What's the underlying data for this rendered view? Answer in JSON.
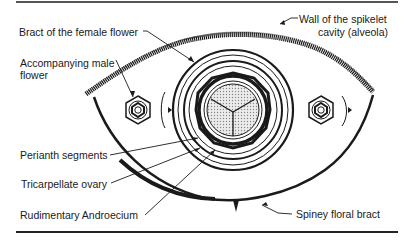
{
  "diagram": {
    "type": "floral-diagram",
    "labels": {
      "bract_female": "Bract of the female flower",
      "male_flower_line1": "Accompanying male",
      "male_flower_line2": "flower",
      "wall_line1": "Wall of the spikelet",
      "wall_line2": "cavity (alveola)",
      "perianth": "Perianth segments",
      "ovary": "Tricarpellate ovary",
      "androecium": "Rudimentary  Androecium",
      "spiney_bract": "Spiney floral bract"
    },
    "colors": {
      "ink": "#1a1a1a",
      "background": "#ffffff",
      "ovary_fill": "#d8d8d8"
    }
  }
}
